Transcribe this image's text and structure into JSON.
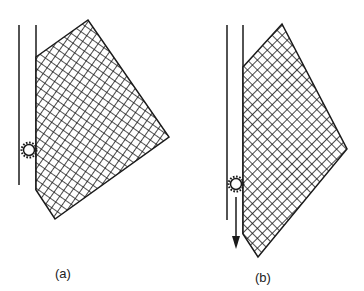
{
  "figure": {
    "panels": [
      {
        "id": "a",
        "label": "(a)",
        "description": "Gear between two vertical rails contacting grid panel; panel tilted",
        "rails_x": [
          19,
          36
        ],
        "rail_top": 25,
        "rail_bottom": [
          185,
          190
        ],
        "panel_polygon": [
          [
            36,
            57
          ],
          [
            88,
            20
          ],
          [
            169,
            137
          ],
          [
            55,
            219
          ],
          [
            36,
            190
          ]
        ],
        "gear": {
          "cx": 29,
          "cy": 150,
          "r": 7
        },
        "grid_angle_deg": 35,
        "label_pos": [
          55,
          275
        ]
      },
      {
        "id": "b",
        "label": "(b)",
        "description": "Panel rotated further; gear moved along rail with downward arrow",
        "rails_x": [
          227,
          243
        ],
        "rail_top": 25,
        "rail_bottom": [
          220,
          234
        ],
        "panel_polygon": [
          [
            243,
            67
          ],
          [
            282,
            24
          ],
          [
            347,
            149
          ],
          [
            258,
            257
          ],
          [
            243,
            234
          ]
        ],
        "gear": {
          "cx": 236,
          "cy": 184,
          "r": 7
        },
        "arrow": {
          "x": 236,
          "y1": 197,
          "y2": 248
        },
        "grid_angle_deg": 45,
        "label_pos": [
          255,
          279
        ]
      }
    ],
    "colors": {
      "ink": "#1a1a1a",
      "background": "#ffffff"
    }
  }
}
